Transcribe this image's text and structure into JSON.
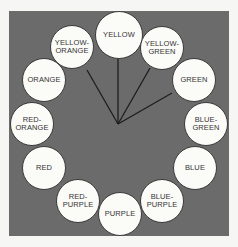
{
  "diagram": {
    "type": "color-wheel",
    "background_color": "#6b6b6b",
    "circle_fill": "#fbfbf8",
    "hub": {
      "x": 118,
      "y": 124
    },
    "circles": [
      {
        "id": "yellow",
        "label": "YELLOW",
        "cx": 119,
        "cy": 35,
        "big": true
      },
      {
        "id": "yellow-green",
        "label": "YELLOW-\nGREEN",
        "cx": 162,
        "cy": 48
      },
      {
        "id": "green",
        "label": "GREEN",
        "cx": 194,
        "cy": 80
      },
      {
        "id": "blue-green",
        "label": "BLUE-\nGREEN",
        "cx": 206,
        "cy": 124
      },
      {
        "id": "blue",
        "label": "BLUE",
        "cx": 195,
        "cy": 168
      },
      {
        "id": "blue-purple",
        "label": "BLUE-\nPURPLE",
        "cx": 162,
        "cy": 201
      },
      {
        "id": "purple",
        "label": "PURPLE",
        "cx": 120,
        "cy": 214
      },
      {
        "id": "red-purple",
        "label": "RED-\nPURPLE",
        "cx": 78,
        "cy": 201
      },
      {
        "id": "red",
        "label": "RED",
        "cx": 44,
        "cy": 168
      },
      {
        "id": "red-orange",
        "label": "RED-\nORANGE",
        "cx": 32,
        "cy": 124
      },
      {
        "id": "orange",
        "label": "ORANGE",
        "cx": 44,
        "cy": 80
      },
      {
        "id": "yellow-orange",
        "label": "YELLOW-\nORANGE",
        "cx": 72,
        "cy": 47
      }
    ],
    "connector_lines": [
      {
        "to": "yellow-orange",
        "x2": 87,
        "y2": 70
      },
      {
        "to": "yellow",
        "x2": 118,
        "y2": 59
      },
      {
        "to": "yellow-green",
        "x2": 150,
        "y2": 68
      },
      {
        "to": "green",
        "x2": 172,
        "y2": 93
      }
    ]
  }
}
